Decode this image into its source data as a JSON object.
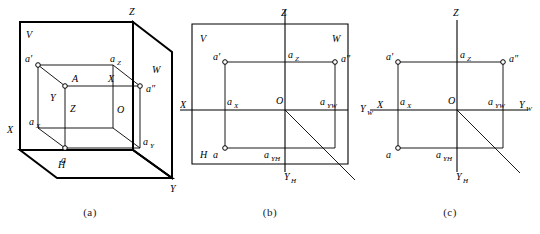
{
  "figure": {
    "panels": [
      {
        "id": "a",
        "caption": "(a)",
        "description": "Pictorial view of the three mutually perpendicular projection planes V, H, W with point A and its projections",
        "plane_labels": {
          "v": "V",
          "h": "H",
          "w": "W"
        },
        "axis_labels": {
          "x": "X",
          "y": "Y",
          "z": "Z"
        },
        "inner_labels": {
          "origin": "O",
          "point": "A",
          "x_inner": "X",
          "y_inner": "Y",
          "z_inner": "Z"
        },
        "point_labels": {
          "v_projection": "a'",
          "w_projection": "a″",
          "h_projection": "a",
          "ax": "a",
          "ax_sub": "X",
          "ay": "a",
          "ay_sub": "Y",
          "az": "a",
          "az_sub": "Z"
        }
      },
      {
        "id": "b",
        "caption": "(b)",
        "description": "Planes unfolded into one plane, frame still drawn",
        "plane_labels": {
          "v": "V",
          "h": "H",
          "w": "W"
        },
        "axis_labels": {
          "x": "X",
          "z": "Z",
          "yh": "Y",
          "yh_sub": "H"
        },
        "inner_labels": {
          "origin": "O"
        },
        "point_labels": {
          "v_projection": "a'",
          "w_projection": "a″",
          "h_projection": "a",
          "ax": "a",
          "ax_sub": "X",
          "az": "a",
          "az_sub": "Z",
          "ayw": "a",
          "ayw_sub": "YW",
          "ayh": "a",
          "ayh_sub": "YH"
        }
      },
      {
        "id": "c",
        "caption": "(c)",
        "description": "Final projection drawing with axes only, frames removed",
        "axis_labels": {
          "x": "X",
          "z": "Z",
          "yw_left": "Y",
          "yw_left_sub": "W",
          "yw_right": "Y",
          "yw_right_sub": "W",
          "yh": "Y",
          "yh_sub": "H"
        },
        "inner_labels": {
          "origin": "O"
        },
        "point_labels": {
          "v_projection": "a'",
          "w_projection": "a″",
          "h_projection": "a",
          "ax": "a",
          "ax_sub": "X",
          "az": "a",
          "az_sub": "Z",
          "ayw": "a",
          "ayw_sub": "YW",
          "ayh": "a",
          "ayh_sub": "YH"
        }
      }
    ]
  },
  "colors": {
    "ink": "#000000",
    "paper": "#ffffff"
  }
}
